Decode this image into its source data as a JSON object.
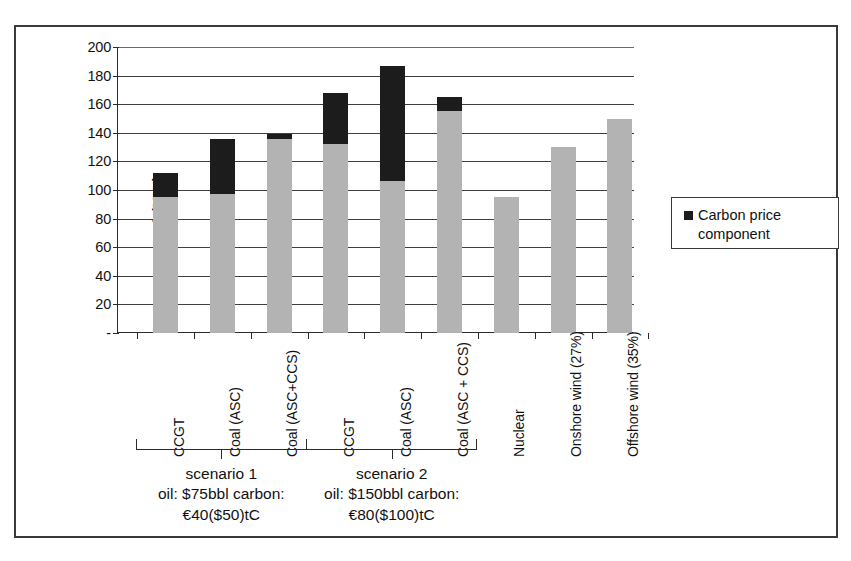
{
  "figure": {
    "y_axis_title": "$ /MWh",
    "y_ticks": [
      "200",
      "180",
      "160",
      "140",
      "120",
      "100",
      "80",
      "60",
      "40",
      "20",
      "-"
    ],
    "legend": {
      "swatch_color": "#1c1c1c",
      "label": "Carbon price component"
    },
    "scenarios": [
      {
        "name": "scenario 1",
        "line2": "oil: $75bbl carbon:",
        "line3": "€40($50)tC"
      },
      {
        "name": "scenario 2",
        "line2": "oil: $150bbl carbon:",
        "line3": "€80($100)tC"
      }
    ]
  },
  "chart_data": {
    "type": "bar",
    "subtype": "stacked",
    "title": "",
    "xlabel": "",
    "ylabel": "$ /MWh",
    "ylim": [
      0,
      200
    ],
    "ytick_step": 20,
    "grid": true,
    "legend_position": "right",
    "colors": {
      "base_cost": "#b3b3b3",
      "carbon_price_component": "#1c1c1c"
    },
    "categories": [
      "CCGT",
      "Coal (ASC)",
      "Coal (ASC+CCS)",
      "CCGT",
      "Coal (ASC)",
      "Coal (ASC + CCS)",
      "Nuclear",
      "Onshore wind (27%)",
      "Offshore wind (35%)"
    ],
    "series": [
      {
        "name": "Base cost",
        "values": [
          95,
          97,
          136,
          132,
          106,
          155,
          95,
          130,
          150
        ]
      },
      {
        "name": "Carbon price component",
        "values": [
          17,
          39,
          3,
          36,
          81,
          10,
          0,
          0,
          0
        ]
      }
    ],
    "totals": [
      112,
      136,
      139,
      168,
      187,
      165,
      95,
      130,
      150
    ],
    "groups": [
      {
        "label": "scenario 1",
        "sublabel": "oil: $75bbl carbon: €40($50)tC",
        "category_indices": [
          0,
          1,
          2
        ]
      },
      {
        "label": "scenario 2",
        "sublabel": "oil: $150bbl carbon: €80($100)tC",
        "category_indices": [
          3,
          4,
          5
        ]
      }
    ]
  }
}
